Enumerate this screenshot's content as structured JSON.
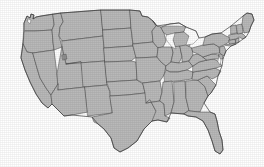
{
  "figure": {
    "type": "reference-map",
    "region": "Contiguous United States (lower 48)",
    "projection_hint": "albers-like conic",
    "canvas": {
      "width": 264,
      "height": 167
    },
    "background_color": "#ffffff",
    "has_labels": false,
    "has_legend": false,
    "has_title_text": false,
    "has_scale_bar": false
  },
  "style": {
    "land_fill": "#b9b9b9",
    "land_fill_alt": "#b2b2b2",
    "border_stroke": "#4a4a4a",
    "outer_stroke": "#3d3d3d",
    "water_fill": "#ffffff",
    "water_stroke": "#5a5a5a",
    "lake_fill": "#8f8f8f"
  },
  "map": {
    "feature_count": 49,
    "state_borders_visible": true,
    "internal_boundaries": "state lines",
    "notable_features": [
      "great-lakes-cutout",
      "lake-michigan",
      "michigan-upper-peninsula",
      "florida-peninsula",
      "texas-gulf-coast",
      "chesapeake-bay",
      "long-island",
      "cape-cod",
      "maine-northeast-corner",
      "puget-sound",
      "great-salt-lake",
      "mississippi-delta",
      "minnesota-arrowhead"
    ],
    "states": [
      {
        "code": "WA",
        "name": "Washington",
        "fill": "#b9b9b9"
      },
      {
        "code": "OR",
        "name": "Oregon",
        "fill": "#b9b9b9"
      },
      {
        "code": "CA",
        "name": "California",
        "fill": "#b9b9b9"
      },
      {
        "code": "NV",
        "name": "Nevada",
        "fill": "#b9b9b9"
      },
      {
        "code": "ID",
        "name": "Idaho",
        "fill": "#b9b9b9"
      },
      {
        "code": "MT",
        "name": "Montana",
        "fill": "#b9b9b9"
      },
      {
        "code": "WY",
        "name": "Wyoming",
        "fill": "#b9b9b9"
      },
      {
        "code": "UT",
        "name": "Utah",
        "fill": "#b9b9b9"
      },
      {
        "code": "AZ",
        "name": "Arizona",
        "fill": "#b9b9b9"
      },
      {
        "code": "CO",
        "name": "Colorado",
        "fill": "#b9b9b9"
      },
      {
        "code": "NM",
        "name": "New Mexico",
        "fill": "#b9b9b9"
      },
      {
        "code": "ND",
        "name": "North Dakota",
        "fill": "#b9b9b9"
      },
      {
        "code": "SD",
        "name": "South Dakota",
        "fill": "#b9b9b9"
      },
      {
        "code": "NE",
        "name": "Nebraska",
        "fill": "#b9b9b9"
      },
      {
        "code": "KS",
        "name": "Kansas",
        "fill": "#b9b9b9"
      },
      {
        "code": "OK",
        "name": "Oklahoma",
        "fill": "#b9b9b9"
      },
      {
        "code": "TX",
        "name": "Texas",
        "fill": "#b9b9b9"
      },
      {
        "code": "MN",
        "name": "Minnesota",
        "fill": "#b9b9b9"
      },
      {
        "code": "IA",
        "name": "Iowa",
        "fill": "#b9b9b9"
      },
      {
        "code": "MO",
        "name": "Missouri",
        "fill": "#b9b9b9"
      },
      {
        "code": "AR",
        "name": "Arkansas",
        "fill": "#b9b9b9"
      },
      {
        "code": "LA",
        "name": "Louisiana",
        "fill": "#b9b9b9"
      },
      {
        "code": "WI",
        "name": "Wisconsin",
        "fill": "#b9b9b9"
      },
      {
        "code": "IL",
        "name": "Illinois",
        "fill": "#b9b9b9"
      },
      {
        "code": "MI",
        "name": "Michigan",
        "fill": "#b9b9b9"
      },
      {
        "code": "IN",
        "name": "Indiana",
        "fill": "#b9b9b9"
      },
      {
        "code": "OH",
        "name": "Ohio",
        "fill": "#b9b9b9"
      },
      {
        "code": "KY",
        "name": "Kentucky",
        "fill": "#b9b9b9"
      },
      {
        "code": "TN",
        "name": "Tennessee",
        "fill": "#b9b9b9"
      },
      {
        "code": "MS",
        "name": "Mississippi",
        "fill": "#b9b9b9"
      },
      {
        "code": "AL",
        "name": "Alabama",
        "fill": "#b9b9b9"
      },
      {
        "code": "GA",
        "name": "Georgia",
        "fill": "#b9b9b9"
      },
      {
        "code": "FL",
        "name": "Florida",
        "fill": "#b9b9b9"
      },
      {
        "code": "SC",
        "name": "South Carolina",
        "fill": "#b9b9b9"
      },
      {
        "code": "NC",
        "name": "North Carolina",
        "fill": "#b9b9b9"
      },
      {
        "code": "VA",
        "name": "Virginia",
        "fill": "#b9b9b9"
      },
      {
        "code": "WV",
        "name": "West Virginia",
        "fill": "#b9b9b9"
      },
      {
        "code": "MD",
        "name": "Maryland",
        "fill": "#b9b9b9"
      },
      {
        "code": "DE",
        "name": "Delaware",
        "fill": "#b9b9b9"
      },
      {
        "code": "PA",
        "name": "Pennsylvania",
        "fill": "#b9b9b9"
      },
      {
        "code": "NJ",
        "name": "New Jersey",
        "fill": "#b9b9b9"
      },
      {
        "code": "NY",
        "name": "New York",
        "fill": "#b9b9b9"
      },
      {
        "code": "CT",
        "name": "Connecticut",
        "fill": "#b9b9b9"
      },
      {
        "code": "RI",
        "name": "Rhode Island",
        "fill": "#b9b9b9"
      },
      {
        "code": "MA",
        "name": "Massachusetts",
        "fill": "#b9b9b9"
      },
      {
        "code": "VT",
        "name": "Vermont",
        "fill": "#b9b9b9"
      },
      {
        "code": "NH",
        "name": "New Hampshire",
        "fill": "#b9b9b9"
      },
      {
        "code": "ME",
        "name": "Maine",
        "fill": "#b9b9b9"
      }
    ]
  }
}
